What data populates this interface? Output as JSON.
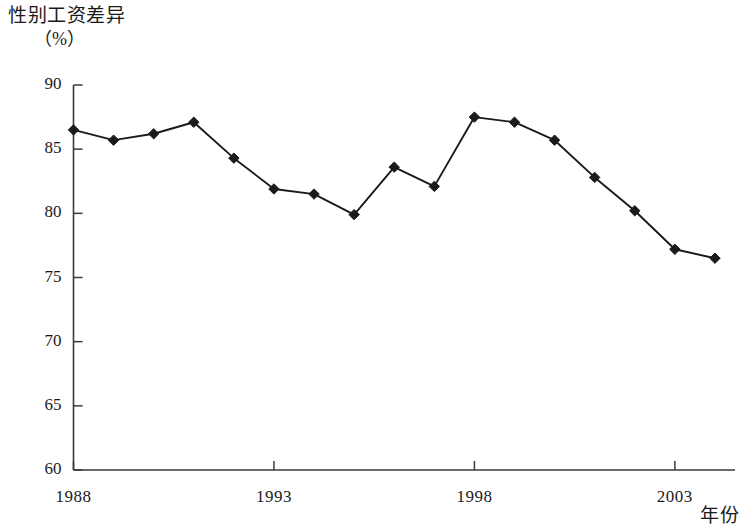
{
  "figure": {
    "title": "性别工资差异",
    "unit_label": "（%）",
    "x_axis_title": "年份"
  },
  "chart_data": {
    "type": "line",
    "title": "性别工资差异",
    "subtitle": "（%）",
    "xlabel": "年份",
    "ylabel": "（%）",
    "xlim": [
      1988,
      2004.5
    ],
    "ylim": [
      60,
      90
    ],
    "yticks": [
      60,
      65,
      70,
      75,
      80,
      85,
      90
    ],
    "ytick_labels": [
      "60",
      "65",
      "70",
      "75",
      "80",
      "85",
      "90"
    ],
    "xticks": [
      1988,
      1993,
      1998,
      2003
    ],
    "xtick_labels": [
      "1988",
      "1993",
      "1998",
      "2003"
    ],
    "grid": false,
    "legend": null,
    "marker": "diamond",
    "line_color": "#1a1a1a",
    "marker_color": "#1a1a1a",
    "x": [
      1988,
      1989,
      1990,
      1991,
      1992,
      1993,
      1994,
      1995,
      1996,
      1997,
      1998,
      1999,
      2000,
      2001,
      2002,
      2003,
      2004
    ],
    "values": [
      86.5,
      85.7,
      86.2,
      87.1,
      84.3,
      81.9,
      81.5,
      79.9,
      83.6,
      82.1,
      87.5,
      87.1,
      85.7,
      82.8,
      80.2,
      77.2,
      76.5
    ],
    "series": [
      {
        "name": "性别工资差异",
        "values": [
          86.5,
          85.7,
          86.2,
          87.1,
          84.3,
          81.9,
          81.5,
          79.9,
          83.6,
          82.1,
          87.5,
          87.1,
          85.7,
          82.8,
          80.2,
          77.2,
          76.5
        ]
      }
    ]
  }
}
